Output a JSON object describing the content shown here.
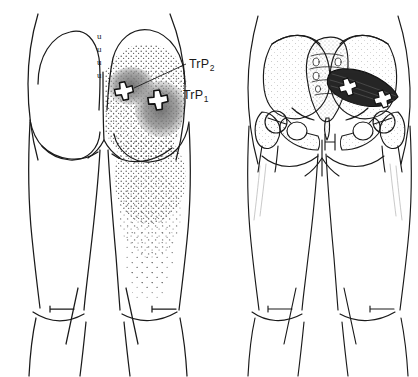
{
  "figure": {
    "kind": "anatomical-trigger-point-diagram",
    "background_color": "#ffffff",
    "ink_color": "#1a1a1a",
    "panels": [
      {
        "id": "left-panel",
        "name": "posterior-body-surface-view",
        "description": "Posterior view of buttocks and thighs with stippled referred pain pattern over right gluteal region and posterior thigh"
      },
      {
        "id": "right-panel",
        "name": "pelvic-skeleton-view",
        "description": "Posterior view of bony pelvis, sacrum and femora with dark piriformis muscle on the left side of the body"
      }
    ]
  },
  "labels": {
    "trp2": {
      "text": "TrP",
      "subscript": "2"
    },
    "trp1": {
      "text": "TrP",
      "subscript": "1"
    }
  },
  "markers": {
    "surface": [
      {
        "name": "trigger-point-2-marker",
        "glyph": "X",
        "cx": 124,
        "cy": 91,
        "rot": -12,
        "scale": 1.0
      },
      {
        "name": "trigger-point-1-marker",
        "glyph": "X",
        "cx": 158,
        "cy": 100,
        "rot": -8,
        "scale": 1.08
      }
    ],
    "skeletal": [
      {
        "name": "trigger-point-2-marker-bone",
        "glyph": "X",
        "cx": 348,
        "cy": 87,
        "rot": -18,
        "scale": 0.95
      },
      {
        "name": "trigger-point-1-marker-bone",
        "glyph": "X",
        "cx": 383,
        "cy": 99,
        "rot": -18,
        "scale": 0.95
      }
    ]
  },
  "pain_pattern": {
    "essential_zone_color": "#7f7f7f",
    "spillover_stipple_color": "#5d5d5d",
    "essential_zones": [
      {
        "name": "essential-zone-upper-gluteal",
        "cx": 131,
        "cy": 86,
        "rx": 21,
        "ry": 17
      },
      {
        "name": "essential-zone-lower-gluteal",
        "cx": 160,
        "cy": 108,
        "rx": 24,
        "ry": 26
      }
    ],
    "spillover_regions": [
      "right-gluteal-region",
      "posterior-thigh-upper",
      "posterior-thigh-middle"
    ]
  },
  "anatomy": {
    "sacral_marks": {
      "name": "sacral-dimple-marks",
      "glyph": "u",
      "count": 4,
      "positions": [
        [
          101,
          36
        ],
        [
          101,
          49
        ],
        [
          101,
          62
        ],
        [
          101,
          75
        ]
      ]
    },
    "muscle": {
      "name": "piriformis-muscle",
      "fill": "#262626"
    }
  }
}
